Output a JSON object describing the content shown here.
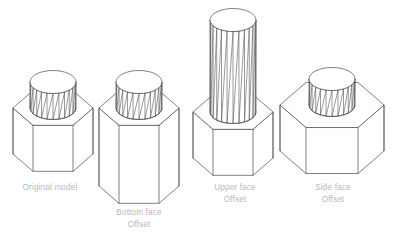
{
  "figure": {
    "background_color": "#ffffff",
    "line_color": "#555555",
    "caption_color": "#b9b9b9",
    "projection": "isometric"
  },
  "models": [
    {
      "id": "original-model",
      "caption_line1": "Original model",
      "caption_line2": "",
      "base_shape": "hexagonal-prism",
      "boss_shape": "faceted-cylinder",
      "base_half_width": 40,
      "base_height": 46,
      "boss_radius": 23,
      "boss_height": 26,
      "facet_count": 12
    },
    {
      "id": "bottom-face-offset",
      "caption_line1": "Bottom face",
      "caption_line2": "Offset",
      "base_shape": "hexagonal-prism",
      "boss_shape": "faceted-cylinder",
      "base_half_width": 40,
      "base_height": 78,
      "boss_radius": 23,
      "boss_height": 26,
      "facet_count": 12
    },
    {
      "id": "upper-face-offset",
      "caption_line1": "Upper face",
      "caption_line2": "Offset",
      "base_shape": "hexagonal-prism",
      "boss_shape": "faceted-cylinder",
      "base_half_width": 40,
      "base_height": 46,
      "boss_radius": 23,
      "boss_height": 92,
      "facet_count": 12
    },
    {
      "id": "side-face-offset",
      "caption_line1": "Side face",
      "caption_line2": "Offset",
      "base_shape": "hexagonal-prism",
      "boss_shape": "faceted-cylinder",
      "base_half_width": 52,
      "base_height": 46,
      "boss_radius": 23,
      "boss_height": 26,
      "facet_count": 12
    }
  ]
}
